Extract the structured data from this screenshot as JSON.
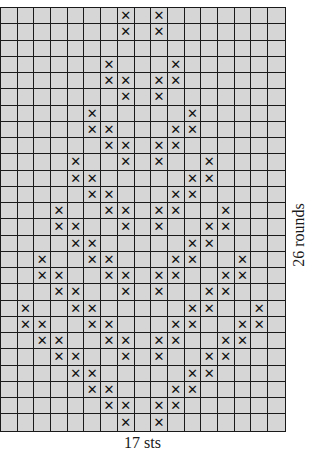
{
  "chart": {
    "columns": 17,
    "rows": 26,
    "cell_color": "#d6d6d6",
    "grid_color": "#1a1a1a",
    "stitch_symbol": "✕",
    "stitch_symbol_name": "x-stitch",
    "marked_cells_by_row": [
      [
        7,
        9
      ],
      [
        7,
        9
      ],
      [],
      [
        6,
        10
      ],
      [
        6,
        7,
        9,
        10
      ],
      [
        7,
        9
      ],
      [
        5,
        11
      ],
      [
        5,
        6,
        10,
        11
      ],
      [
        6,
        7,
        9,
        10
      ],
      [
        4,
        7,
        9,
        12
      ],
      [
        4,
        5,
        11,
        12
      ],
      [
        5,
        6,
        10,
        11
      ],
      [
        3,
        6,
        7,
        9,
        10,
        13
      ],
      [
        3,
        4,
        7,
        9,
        12,
        13
      ],
      [
        4,
        5,
        11,
        12
      ],
      [
        2,
        5,
        6,
        10,
        11,
        14
      ],
      [
        2,
        3,
        6,
        7,
        9,
        10,
        13,
        14
      ],
      [
        3,
        4,
        7,
        9,
        12,
        13
      ],
      [
        1,
        4,
        5,
        11,
        12,
        15
      ],
      [
        1,
        2,
        5,
        6,
        10,
        11,
        14,
        15
      ],
      [
        2,
        3,
        6,
        7,
        9,
        10,
        13,
        14
      ],
      [
        3,
        4,
        7,
        9,
        12,
        13
      ],
      [
        4,
        5,
        11,
        12
      ],
      [
        5,
        6,
        10,
        11
      ],
      [
        6,
        7,
        9,
        10
      ],
      [
        7,
        9
      ]
    ]
  },
  "labels": {
    "rounds": "26 rounds",
    "stitches": "17 sts"
  }
}
